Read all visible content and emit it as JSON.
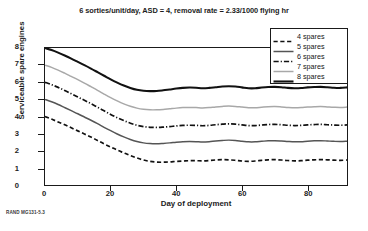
{
  "figure": {
    "title": "6 sorties/unit/day, ASD = 4, removal rate = 2.33/1000 flying hr",
    "footer": "RAND MG131-5.3"
  },
  "chart_data": {
    "type": "line",
    "title": "6 sorties/unit/day, ASD = 4, removal rate = 2.33/1000 flying hr",
    "xlabel": "Day of deployment",
    "ylabel": "Serviceable spare engines",
    "xlim": [
      0,
      92
    ],
    "ylim": [
      0,
      8
    ],
    "xticks": [
      0,
      20,
      40,
      60,
      80
    ],
    "yticks": [
      0,
      1,
      2,
      3,
      4,
      5,
      6,
      7,
      8
    ],
    "grid": false,
    "legend_position": "top-right",
    "series": [
      {
        "name": "4 spares",
        "color": "#111111",
        "style": "dashed",
        "width": 1.7,
        "start_value": 4.0,
        "plateau_value": 1.4,
        "x": [
          0,
          2,
          4,
          6,
          8,
          10,
          12,
          14,
          16,
          18,
          20,
          22,
          24,
          26,
          28,
          30,
          32,
          34,
          36,
          38,
          40,
          42,
          44,
          46,
          48,
          50,
          52,
          54,
          56,
          58,
          60,
          62,
          64,
          66,
          68,
          70,
          72,
          74,
          76,
          78,
          80,
          82,
          84,
          86,
          88,
          90,
          92
        ],
        "y": [
          4.0,
          3.85,
          3.68,
          3.52,
          3.34,
          3.16,
          2.98,
          2.8,
          2.6,
          2.4,
          2.22,
          2.04,
          1.88,
          1.72,
          1.58,
          1.46,
          1.38,
          1.34,
          1.33,
          1.35,
          1.38,
          1.4,
          1.42,
          1.42,
          1.41,
          1.43,
          1.46,
          1.48,
          1.47,
          1.44,
          1.4,
          1.38,
          1.4,
          1.44,
          1.47,
          1.48,
          1.46,
          1.43,
          1.41,
          1.42,
          1.45,
          1.47,
          1.48,
          1.47,
          1.45,
          1.44,
          1.46
        ]
      },
      {
        "name": "5 spares",
        "color": "#555555",
        "style": "solid",
        "width": 1.5,
        "start_value": 5.0,
        "plateau_value": 2.5,
        "x": [
          0,
          2,
          4,
          6,
          8,
          10,
          12,
          14,
          16,
          18,
          20,
          22,
          24,
          26,
          28,
          30,
          32,
          34,
          36,
          38,
          40,
          42,
          44,
          46,
          48,
          50,
          52,
          54,
          56,
          58,
          60,
          62,
          64,
          66,
          68,
          70,
          72,
          74,
          76,
          78,
          80,
          82,
          84,
          86,
          88,
          90,
          92
        ],
        "y": [
          5.0,
          4.86,
          4.7,
          4.52,
          4.34,
          4.16,
          3.97,
          3.78,
          3.58,
          3.37,
          3.17,
          2.98,
          2.81,
          2.66,
          2.54,
          2.46,
          2.42,
          2.41,
          2.43,
          2.46,
          2.5,
          2.53,
          2.54,
          2.53,
          2.51,
          2.53,
          2.57,
          2.6,
          2.62,
          2.6,
          2.56,
          2.52,
          2.52,
          2.55,
          2.58,
          2.59,
          2.57,
          2.54,
          2.52,
          2.53,
          2.56,
          2.58,
          2.59,
          2.57,
          2.55,
          2.54,
          2.56
        ]
      },
      {
        "name": "6 spares",
        "color": "#111111",
        "style": "dashdot",
        "width": 1.7,
        "start_value": 6.0,
        "plateau_value": 3.4,
        "x": [
          0,
          2,
          4,
          6,
          8,
          10,
          12,
          14,
          16,
          18,
          20,
          22,
          24,
          26,
          28,
          30,
          32,
          34,
          36,
          38,
          40,
          42,
          44,
          46,
          48,
          50,
          52,
          54,
          56,
          58,
          60,
          62,
          64,
          66,
          68,
          70,
          72,
          74,
          76,
          78,
          80,
          82,
          84,
          86,
          88,
          90,
          92
        ],
        "y": [
          6.0,
          5.86,
          5.7,
          5.52,
          5.33,
          5.14,
          4.95,
          4.75,
          4.54,
          4.33,
          4.12,
          3.93,
          3.76,
          3.61,
          3.49,
          3.41,
          3.37,
          3.36,
          3.38,
          3.41,
          3.45,
          3.48,
          3.49,
          3.48,
          3.46,
          3.48,
          3.52,
          3.55,
          3.57,
          3.55,
          3.51,
          3.47,
          3.47,
          3.5,
          3.53,
          3.54,
          3.52,
          3.49,
          3.47,
          3.48,
          3.51,
          3.53,
          3.54,
          3.52,
          3.5,
          3.49,
          3.51
        ]
      },
      {
        "name": "7 spares",
        "color": "#a8a8a8",
        "style": "solid",
        "width": 1.5,
        "start_value": 7.0,
        "plateau_value": 4.5,
        "x": [
          0,
          2,
          4,
          6,
          8,
          10,
          12,
          14,
          16,
          18,
          20,
          22,
          24,
          26,
          28,
          30,
          32,
          34,
          36,
          38,
          40,
          42,
          44,
          46,
          48,
          50,
          52,
          54,
          56,
          58,
          60,
          62,
          64,
          66,
          68,
          70,
          72,
          74,
          76,
          78,
          80,
          82,
          84,
          86,
          88,
          90,
          92
        ],
        "y": [
          7.0,
          6.87,
          6.71,
          6.53,
          6.34,
          6.15,
          5.95,
          5.74,
          5.53,
          5.31,
          5.1,
          4.91,
          4.74,
          4.6,
          4.49,
          4.42,
          4.39,
          4.39,
          4.41,
          4.45,
          4.49,
          4.52,
          4.53,
          4.52,
          4.5,
          4.52,
          4.56,
          4.59,
          4.61,
          4.59,
          4.55,
          4.51,
          4.51,
          4.54,
          4.57,
          4.58,
          4.56,
          4.53,
          4.51,
          4.52,
          4.55,
          4.57,
          4.58,
          4.56,
          4.54,
          4.53,
          4.55
        ]
      },
      {
        "name": "8 spares",
        "color": "#111111",
        "style": "solid",
        "width": 2.1,
        "start_value": 8.0,
        "plateau_value": 5.65,
        "x": [
          0,
          2,
          4,
          6,
          8,
          10,
          12,
          14,
          16,
          18,
          20,
          22,
          24,
          26,
          28,
          30,
          32,
          34,
          36,
          38,
          40,
          42,
          44,
          46,
          48,
          50,
          52,
          54,
          56,
          58,
          60,
          62,
          64,
          66,
          68,
          70,
          72,
          74,
          76,
          78,
          80,
          82,
          84,
          86,
          88,
          90,
          92
        ],
        "y": [
          8.0,
          7.88,
          7.73,
          7.56,
          7.38,
          7.19,
          7.0,
          6.8,
          6.59,
          6.38,
          6.17,
          5.98,
          5.81,
          5.67,
          5.56,
          5.5,
          5.48,
          5.49,
          5.53,
          5.58,
          5.63,
          5.67,
          5.69,
          5.68,
          5.65,
          5.67,
          5.71,
          5.75,
          5.77,
          5.75,
          5.7,
          5.65,
          5.65,
          5.69,
          5.72,
          5.73,
          5.71,
          5.67,
          5.65,
          5.66,
          5.7,
          5.72,
          5.73,
          5.71,
          5.68,
          5.67,
          5.7
        ]
      }
    ]
  },
  "axes": {
    "y_tick_labels": [
      "8",
      "7",
      "6",
      "5",
      "4",
      "3",
      "2",
      "1",
      "0"
    ],
    "x_tick_labels": [
      "0",
      "20",
      "40",
      "60",
      "80"
    ]
  },
  "legend": {
    "entries": [
      {
        "label": "4 spares"
      },
      {
        "label": "5 spares"
      },
      {
        "label": "6 spares"
      },
      {
        "label": "7 spares"
      },
      {
        "label": "8 spares"
      }
    ]
  }
}
